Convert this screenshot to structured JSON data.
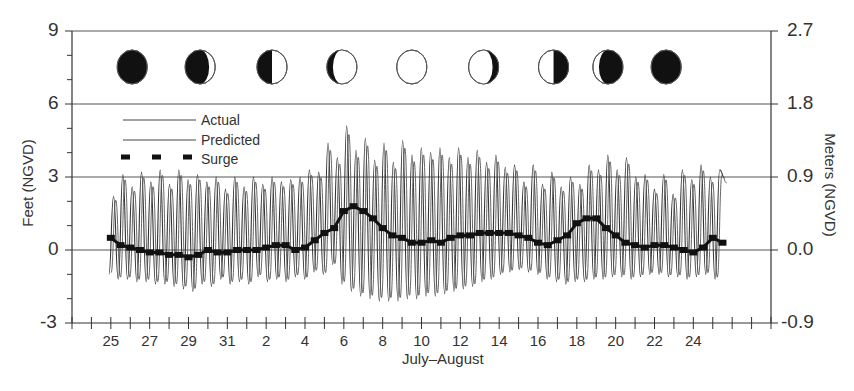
{
  "chart_data": {
    "type": "line",
    "title": "",
    "xlabel": "July–August",
    "ylabel_left": "Feet (NGVD)",
    "ylabel_right": "Meters (NGVD)",
    "ylim_left": [
      -3,
      9
    ],
    "ylim_right": [
      -0.9,
      2.7
    ],
    "yticks_left": [
      "9",
      "6",
      "3",
      "0",
      "-3"
    ],
    "yticks_right": [
      "2.7",
      "1.8",
      "0.9",
      "0.0",
      "-0.9"
    ],
    "grid_lines_y_ft": [
      6,
      3,
      0
    ],
    "x_tick_labels": [
      "25",
      "27",
      "29",
      "31",
      "2",
      "4",
      "6",
      "8",
      "10",
      "12",
      "14",
      "16",
      "18",
      "20",
      "22",
      "24"
    ],
    "x_day_index_start": 23,
    "x_days_span": 36,
    "legend": {
      "position": "upper-left",
      "entries": [
        {
          "label": "Actual",
          "style": "thin-line"
        },
        {
          "label": "Predicted",
          "style": "thin-line"
        },
        {
          "label": "Surge",
          "style": "thick-dashed"
        }
      ]
    },
    "moon_phases": [
      {
        "day_offset": 3.1,
        "phase": "new"
      },
      {
        "day_offset": 6.6,
        "phase": "waxing-crescent"
      },
      {
        "day_offset": 10.3,
        "phase": "first-quarter"
      },
      {
        "day_offset": 13.9,
        "phase": "waxing-gibbous"
      },
      {
        "day_offset": 17.5,
        "phase": "full"
      },
      {
        "day_offset": 21.2,
        "phase": "waning-gibbous"
      },
      {
        "day_offset": 24.8,
        "phase": "last-quarter"
      },
      {
        "day_offset": 27.6,
        "phase": "waning-crescent"
      },
      {
        "day_offset": 30.6,
        "phase": "new"
      }
    ],
    "series": [
      {
        "name": "Actual",
        "description": "Semi-diurnal tide, ~2 cycles/day, ft NGVD",
        "start_day_offset": 1.9,
        "end_day_offset": 33.6,
        "high_tide_peaks_ft": [
          2.2,
          3.1,
          2.6,
          3.2,
          2.8,
          3.3,
          2.7,
          3.3,
          2.9,
          3.1,
          2.8,
          3.0,
          2.5,
          3.0,
          2.6,
          3.0,
          2.7,
          3.0,
          2.8,
          2.9,
          3.0,
          3.3,
          3.2,
          4.4,
          3.8,
          5.1,
          4.1,
          4.6,
          3.7,
          4.4,
          3.6,
          4.5,
          3.9,
          4.2,
          4.0,
          4.2,
          3.8,
          4.2,
          3.8,
          4.1,
          3.6,
          3.9,
          3.4,
          3.5,
          2.8,
          3.5,
          2.7,
          3.2,
          2.6,
          3.0,
          2.7,
          3.5,
          3.3,
          3.9,
          3.3,
          3.8,
          3.0,
          3.1,
          2.5,
          3.1,
          2.3,
          3.3,
          2.9,
          3.5,
          3.0,
          3.3
        ],
        "low_tide_troughs_ft": [
          -1.0,
          -1.2,
          -1.2,
          -1.3,
          -1.3,
          -1.4,
          -1.4,
          -1.5,
          -1.6,
          -1.7,
          -1.4,
          -1.5,
          -1.2,
          -1.4,
          -1.3,
          -1.4,
          -1.1,
          -1.3,
          -1.2,
          -1.3,
          -1.1,
          -1.2,
          -0.9,
          -1.0,
          -0.6,
          -1.4,
          -1.7,
          -1.9,
          -2.0,
          -2.1,
          -2.1,
          -2.1,
          -2.0,
          -2.0,
          -1.9,
          -1.9,
          -1.8,
          -1.7,
          -1.6,
          -1.5,
          -1.3,
          -1.2,
          -1.0,
          -0.9,
          -0.8,
          -0.9,
          -1.0,
          -1.2,
          -1.3,
          -1.4,
          -1.3,
          -1.3,
          -1.2,
          -1.2,
          -1.1,
          -1.1,
          -1.2,
          -1.1,
          -1.0,
          -1.0,
          -1.1,
          -1.1,
          -1.2,
          -1.1,
          -1.0,
          -1.2
        ]
      },
      {
        "name": "Predicted",
        "description": "Predicted astronomical tide, nearly coincident with Actual"
      },
      {
        "name": "Surge",
        "description": "Residual (Actual − Predicted), daily-smoothed, ft NGVD",
        "x_day_offsets": [
          2,
          2.5,
          3,
          3.5,
          4,
          4.5,
          5,
          5.5,
          6,
          6.5,
          7,
          7.5,
          8,
          8.5,
          9,
          9.5,
          10,
          10.5,
          11,
          11.5,
          12,
          12.5,
          13,
          13.5,
          14,
          14.5,
          15,
          15.5,
          16,
          16.5,
          17,
          17.5,
          18,
          18.5,
          19,
          19.5,
          20,
          20.5,
          21,
          21.5,
          22,
          22.5,
          23,
          23.5,
          24,
          24.5,
          25,
          25.5,
          26,
          26.5,
          27,
          27.5,
          28,
          28.5,
          29,
          29.5,
          30,
          30.5,
          31,
          31.5,
          32,
          32.5,
          33,
          33.5
        ],
        "values_ft": [
          0.5,
          0.2,
          0.1,
          0.0,
          -0.1,
          -0.1,
          -0.2,
          -0.2,
          -0.3,
          -0.2,
          0.0,
          -0.1,
          -0.1,
          0.0,
          0.0,
          0.0,
          0.1,
          0.2,
          0.2,
          0.0,
          0.1,
          0.4,
          0.7,
          0.9,
          1.6,
          1.8,
          1.6,
          1.3,
          0.9,
          0.6,
          0.5,
          0.3,
          0.3,
          0.4,
          0.3,
          0.5,
          0.6,
          0.6,
          0.7,
          0.7,
          0.7,
          0.7,
          0.6,
          0.5,
          0.3,
          0.2,
          0.4,
          0.6,
          1.1,
          1.3,
          1.3,
          0.9,
          0.6,
          0.3,
          0.2,
          0.1,
          0.2,
          0.2,
          0.1,
          0.0,
          -0.1,
          0.1,
          0.5,
          0.3
        ]
      }
    ]
  }
}
